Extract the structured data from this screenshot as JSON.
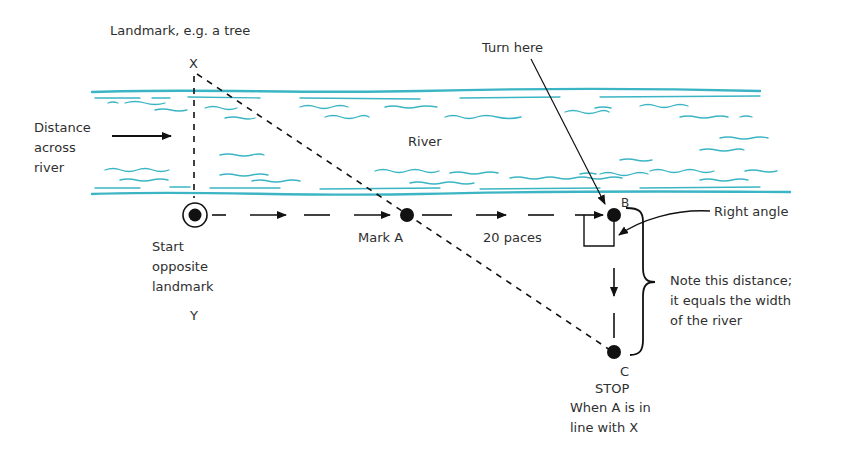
{
  "diagram": {
    "colors": {
      "water": "#3bb5c4",
      "ink": "#111111",
      "text": "#2f2f2f"
    },
    "labels": {
      "landmark": "Landmark, e.g. a tree",
      "point_x": "X",
      "turn_here": "Turn here",
      "river": "River",
      "distance_across": "Distance\nacross\nriver",
      "point_b": "B",
      "right_angle": "Right angle",
      "start": "Start\nopposite\nlandmark",
      "point_y": "Y",
      "mark_a": "Mark A",
      "paces": "20 paces",
      "note_distance": "Note this distance;\nit equals the width\nof the river",
      "point_c": "C",
      "stop": "STOP",
      "stop_condition": "When A is in\nline with X"
    },
    "points": [
      {
        "id": "X",
        "role": "landmark on far bank"
      },
      {
        "id": "Y",
        "role": "start point opposite landmark"
      },
      {
        "id": "A",
        "role": "marker placed after 20 paces"
      },
      {
        "id": "B",
        "role": "turn point after another 20 paces"
      },
      {
        "id": "C",
        "role": "stop point where A aligns with X"
      }
    ]
  }
}
